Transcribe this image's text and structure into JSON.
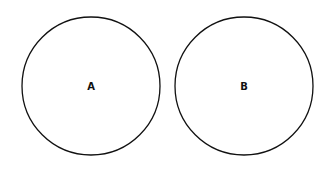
{
  "diagram": {
    "circles": [
      {
        "label": "A",
        "cx": 91,
        "cy": 86,
        "r": 69
      },
      {
        "label": "B",
        "cx": 244,
        "cy": 86,
        "r": 69
      }
    ],
    "stroke_color": "#111111",
    "fill_color": "#ffffff"
  }
}
